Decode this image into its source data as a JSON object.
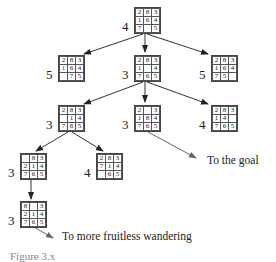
{
  "diagram": {
    "type": "search-tree",
    "puzzle": "8-puzzle",
    "nodes": [
      {
        "id": "root",
        "h": "4",
        "tiles": [
          "2",
          "8",
          "3",
          "1",
          "6",
          "4",
          "7",
          "",
          "5"
        ]
      },
      {
        "id": "l1-left",
        "h": "5",
        "tiles": [
          "2",
          "8",
          "3",
          "1",
          "6",
          "4",
          "",
          "7",
          "5"
        ]
      },
      {
        "id": "l1-mid",
        "h": "3",
        "tiles": [
          "2",
          "8",
          "3",
          "1",
          "",
          "4",
          "7",
          "6",
          "5"
        ]
      },
      {
        "id": "l1-right",
        "h": "5",
        "tiles": [
          "2",
          "8",
          "3",
          "1",
          "6",
          "4",
          "7",
          "5",
          ""
        ]
      },
      {
        "id": "l2-left",
        "h": "3",
        "tiles": [
          "2",
          "8",
          "3",
          "",
          "1",
          "4",
          "7",
          "6",
          "5"
        ]
      },
      {
        "id": "l2-mid",
        "h": "3",
        "tiles": [
          "2",
          "",
          "3",
          "1",
          "8",
          "4",
          "7",
          "6",
          "5"
        ]
      },
      {
        "id": "l2-right",
        "h": "4",
        "tiles": [
          "2",
          "8",
          "3",
          "1",
          "4",
          "",
          "7",
          "6",
          "5"
        ]
      },
      {
        "id": "l3-left",
        "h": "3",
        "tiles": [
          "",
          "8",
          "3",
          "2",
          "1",
          "4",
          "7",
          "6",
          "5"
        ]
      },
      {
        "id": "l3-right",
        "h": "4",
        "tiles": [
          "2",
          "8",
          "3",
          "7",
          "1",
          "4",
          "",
          "6",
          "5"
        ]
      },
      {
        "id": "l4",
        "h": "3",
        "tiles": [
          "8",
          "",
          "3",
          "2",
          "1",
          "4",
          "7",
          "6",
          "5"
        ]
      }
    ],
    "edges": [
      [
        "root",
        "l1-left"
      ],
      [
        "root",
        "l1-mid"
      ],
      [
        "root",
        "l1-right"
      ],
      [
        "l1-mid",
        "l2-left"
      ],
      [
        "l1-mid",
        "l2-mid"
      ],
      [
        "l1-mid",
        "l2-right"
      ],
      [
        "l2-left",
        "l3-left"
      ],
      [
        "l2-left",
        "l3-right"
      ],
      [
        "l3-left",
        "l4"
      ]
    ],
    "annotations": {
      "goal": "To the goal",
      "wandering": "To more fruitless wandering"
    },
    "caption": "Figure 3.x"
  }
}
